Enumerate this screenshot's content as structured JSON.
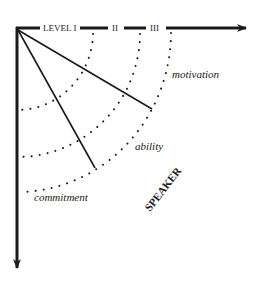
{
  "diagram": {
    "axis_labels": {
      "level1": "LEVEL I",
      "level2": "II",
      "level3": "III"
    },
    "arc_labels": {
      "outer": "motivation",
      "middle": "ability",
      "inner": "commitment"
    },
    "direction_label": "SPEAKER",
    "colors": {
      "ink": "#1a1a1a",
      "background": "#ffffff"
    }
  }
}
